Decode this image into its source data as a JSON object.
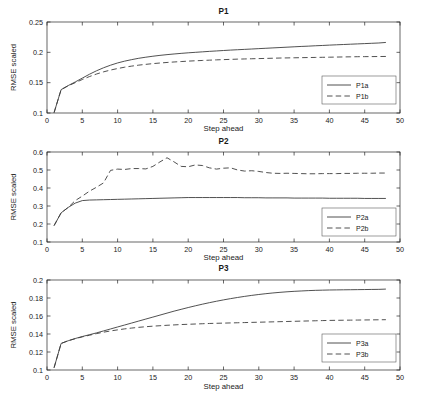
{
  "figure": {
    "background": "#ffffff",
    "line_color": "#3d3d3d",
    "axis_color": "#262626"
  },
  "chart_data": [
    {
      "type": "line",
      "title": "P1",
      "xlabel": "Step ahead",
      "ylabel": "RMSE scaled",
      "xlim": [
        0,
        50
      ],
      "ylim": [
        0.1,
        0.25
      ],
      "xticks": [
        0,
        5,
        10,
        15,
        20,
        25,
        30,
        35,
        40,
        45,
        50
      ],
      "xticklabels": [
        "0",
        "5",
        "10",
        "15",
        "20",
        "25",
        "30",
        "35",
        "40",
        "45",
        "50"
      ],
      "yticks": [
        0.1,
        0.15,
        0.2,
        0.25
      ],
      "yticklabels": [
        "0.1",
        "0.15",
        "0.2",
        "0.25"
      ],
      "grid": false,
      "legend_position": "lower right",
      "x": [
        1,
        2,
        3,
        4,
        5,
        6,
        7,
        8,
        9,
        10,
        11,
        12,
        13,
        14,
        15,
        16,
        17,
        18,
        19,
        20,
        21,
        22,
        23,
        24,
        25,
        26,
        27,
        28,
        29,
        30,
        31,
        32,
        33,
        34,
        35,
        36,
        37,
        38,
        39,
        40,
        41,
        42,
        43,
        44,
        45,
        46,
        47,
        48
      ],
      "series": [
        {
          "name": "P1a",
          "style": "solid",
          "values": [
            0.1005,
            0.1385,
            0.1452,
            0.1512,
            0.1575,
            0.1638,
            0.1695,
            0.1745,
            0.1788,
            0.1825,
            0.1855,
            0.188,
            0.1902,
            0.192,
            0.1936,
            0.195,
            0.1962,
            0.1973,
            0.1983,
            0.1992,
            0.2,
            0.2008,
            0.2016,
            0.2023,
            0.203,
            0.2037,
            0.2043,
            0.2049,
            0.2055,
            0.2061,
            0.2067,
            0.2073,
            0.2079,
            0.2085,
            0.2091,
            0.2097,
            0.2102,
            0.2108,
            0.2113,
            0.2119,
            0.2124,
            0.2129,
            0.2134,
            0.2139,
            0.2144,
            0.2149,
            0.2154,
            0.2163
          ]
        },
        {
          "name": "P1b",
          "style": "dashed",
          "values": [
            0.1005,
            0.1385,
            0.1448,
            0.15,
            0.1552,
            0.16,
            0.1642,
            0.1678,
            0.1708,
            0.1733,
            0.1755,
            0.1773,
            0.1789,
            0.1802,
            0.1814,
            0.1824,
            0.1833,
            0.1841,
            0.1848,
            0.1855,
            0.1861,
            0.1866,
            0.1871,
            0.1876,
            0.188,
            0.1884,
            0.1888,
            0.1891,
            0.1894,
            0.1897,
            0.19,
            0.1903,
            0.1906,
            0.1908,
            0.191,
            0.1912,
            0.1914,
            0.1916,
            0.1918,
            0.192,
            0.1922,
            0.1924,
            0.1926,
            0.1928,
            0.1929,
            0.193,
            0.1931,
            0.1932
          ]
        }
      ]
    },
    {
      "type": "line",
      "title": "P2",
      "xlabel": "Step ahead",
      "ylabel": "RMSE scaled",
      "xlim": [
        0,
        50
      ],
      "ylim": [
        0.1,
        0.6
      ],
      "xticks": [
        0,
        5,
        10,
        15,
        20,
        25,
        30,
        35,
        40,
        45,
        50
      ],
      "xticklabels": [
        "0",
        "5",
        "10",
        "15",
        "20",
        "25",
        "30",
        "35",
        "40",
        "45",
        "50"
      ],
      "yticks": [
        0.1,
        0.2,
        0.3,
        0.4,
        0.5,
        0.6
      ],
      "yticklabels": [
        "0.1",
        "0.2",
        "0.3",
        "0.4",
        "0.5",
        "0.6"
      ],
      "grid": false,
      "legend_position": "lower right",
      "x": [
        1,
        2,
        3,
        4,
        5,
        6,
        7,
        8,
        9,
        10,
        11,
        12,
        13,
        14,
        15,
        16,
        17,
        18,
        19,
        20,
        21,
        22,
        23,
        24,
        25,
        26,
        27,
        28,
        29,
        30,
        31,
        32,
        33,
        34,
        35,
        36,
        37,
        38,
        39,
        40,
        41,
        42,
        43,
        44,
        45,
        46,
        47,
        48
      ],
      "series": [
        {
          "name": "P2a",
          "style": "solid",
          "values": [
            0.191,
            0.262,
            0.292,
            0.316,
            0.33,
            0.333,
            0.334,
            0.335,
            0.336,
            0.337,
            0.338,
            0.339,
            0.34,
            0.341,
            0.342,
            0.343,
            0.344,
            0.345,
            0.346,
            0.347,
            0.347,
            0.347,
            0.347,
            0.347,
            0.347,
            0.347,
            0.347,
            0.346,
            0.346,
            0.346,
            0.345,
            0.345,
            0.345,
            0.345,
            0.344,
            0.344,
            0.344,
            0.344,
            0.344,
            0.343,
            0.343,
            0.343,
            0.343,
            0.343,
            0.342,
            0.342,
            0.342,
            0.342
          ]
        },
        {
          "name": "P2b",
          "style": "dashed",
          "values": [
            0.191,
            0.262,
            0.292,
            0.33,
            0.355,
            0.382,
            0.404,
            0.428,
            0.498,
            0.505,
            0.503,
            0.508,
            0.508,
            0.506,
            0.52,
            0.545,
            0.568,
            0.545,
            0.52,
            0.518,
            0.528,
            0.525,
            0.512,
            0.505,
            0.51,
            0.512,
            0.5,
            0.494,
            0.496,
            0.492,
            0.486,
            0.482,
            0.481,
            0.482,
            0.481,
            0.48,
            0.479,
            0.479,
            0.48,
            0.48,
            0.48,
            0.481,
            0.481,
            0.482,
            0.482,
            0.482,
            0.483,
            0.483
          ]
        }
      ]
    },
    {
      "type": "line",
      "title": "P3",
      "xlabel": "Step ahead",
      "ylabel": "RMSE scaled",
      "xlim": [
        0,
        50
      ],
      "ylim": [
        0.1,
        0.2
      ],
      "xticks": [
        0,
        5,
        10,
        15,
        20,
        25,
        30,
        35,
        40,
        45,
        50
      ],
      "xticklabels": [
        "0",
        "5",
        "10",
        "15",
        "20",
        "25",
        "30",
        "35",
        "40",
        "45",
        "50"
      ],
      "yticks": [
        0.1,
        0.12,
        0.14,
        0.16,
        0.18,
        0.2
      ],
      "yticklabels": [
        "0.1",
        "0.12",
        "0.14",
        "0.16",
        "0.18",
        "0.2"
      ],
      "grid": false,
      "legend_position": "lower right",
      "x": [
        1,
        2,
        3,
        4,
        5,
        6,
        7,
        8,
        9,
        10,
        11,
        12,
        13,
        14,
        15,
        16,
        17,
        18,
        19,
        20,
        21,
        22,
        23,
        24,
        25,
        26,
        27,
        28,
        29,
        30,
        31,
        32,
        33,
        34,
        35,
        36,
        37,
        38,
        39,
        40,
        41,
        42,
        43,
        44,
        45,
        46,
        47,
        48
      ],
      "series": [
        {
          "name": "P3a",
          "style": "solid",
          "values": [
            0.1025,
            0.1295,
            0.1325,
            0.135,
            0.1372,
            0.1392,
            0.1412,
            0.1434,
            0.1456,
            0.1478,
            0.15,
            0.1522,
            0.1544,
            0.1566,
            0.1588,
            0.161,
            0.1632,
            0.1654,
            0.1674,
            0.1694,
            0.1713,
            0.1731,
            0.1748,
            0.1764,
            0.1779,
            0.1793,
            0.1806,
            0.1818,
            0.1829,
            0.1839,
            0.1848,
            0.1856,
            0.1863,
            0.1869,
            0.1874,
            0.1878,
            0.1882,
            0.1885,
            0.1887,
            0.1889,
            0.189,
            0.1891,
            0.1892,
            0.1893,
            0.1894,
            0.1895,
            0.1896,
            0.1899
          ]
        },
        {
          "name": "P3b",
          "style": "dashed",
          "values": [
            0.1025,
            0.1295,
            0.1325,
            0.1348,
            0.1368,
            0.1386,
            0.1404,
            0.142,
            0.1434,
            0.1446,
            0.1457,
            0.1466,
            0.1474,
            0.1481,
            0.1487,
            0.1492,
            0.1497,
            0.1501,
            0.1505,
            0.1508,
            0.1511,
            0.1514,
            0.1517,
            0.1519,
            0.1521,
            0.1523,
            0.1525,
            0.1527,
            0.1529,
            0.1531,
            0.1533,
            0.1535,
            0.1537,
            0.1539,
            0.1541,
            0.1543,
            0.1545,
            0.1547,
            0.1549,
            0.1551,
            0.1552,
            0.1553,
            0.1554,
            0.1555,
            0.1556,
            0.1557,
            0.1558,
            0.1559
          ]
        }
      ]
    }
  ]
}
